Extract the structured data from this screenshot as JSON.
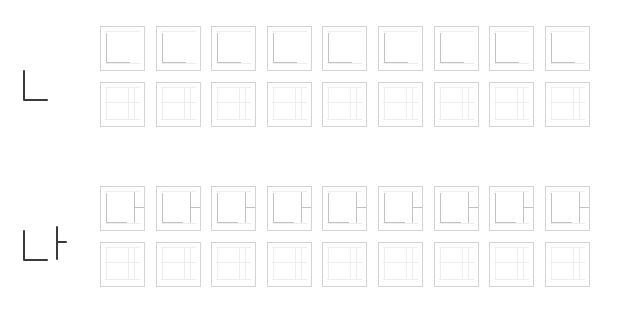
{
  "worksheet": {
    "rows": [
      {
        "character": "ㄴ",
        "sample_top": 70,
        "trace_row_top": 26,
        "blank_row_top": 82,
        "box_count": 9
      },
      {
        "character": "나",
        "sample_top": 230,
        "trace_row_top": 186,
        "blank_row_top": 242,
        "box_count": 9
      }
    ],
    "box_left_start": 100,
    "box_spacing": 55.6,
    "colors": {
      "sample_stroke": "#3a3a3a",
      "box_border": "#d4d4d4",
      "trace_stroke": "#c2c2c2",
      "guide_line": "#eeeeee"
    }
  }
}
